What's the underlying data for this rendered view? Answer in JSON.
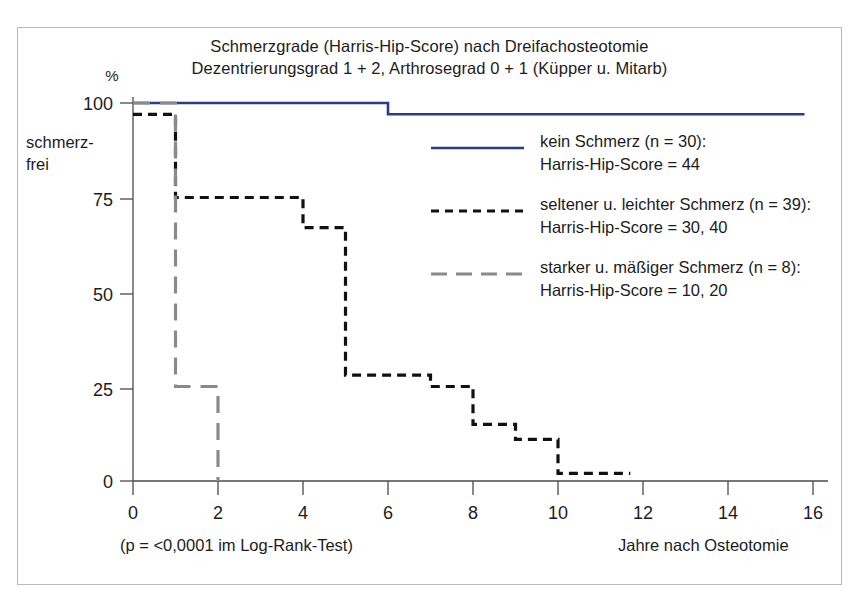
{
  "figure": {
    "title_line1": "Schmerzgrade (Harris-Hip-Score) nach Dreifachosteotomie",
    "title_line2": "Dezentrierungsgrad 1 + 2, Arthrosegrad 0 + 1 (Küpper u. Mitarb)",
    "border_color": "#b9b9b9",
    "background": "#ffffff"
  },
  "axes": {
    "y_unit": "%",
    "y_axis_label_line1": "schmerz-",
    "y_axis_label_line2": "frei",
    "x_axis_label": "Jahre nach Osteotomie",
    "footnote": "(p = <0,0001 im Log-Rank-Test)",
    "y_ticks": [
      "100",
      "75",
      "50",
      "25",
      "0"
    ],
    "x_ticks": [
      "0",
      "2",
      "4",
      "6",
      "8",
      "10",
      "12",
      "14",
      "16"
    ]
  },
  "legend": {
    "position": "inside-top-right",
    "entries": [
      {
        "style": "solid",
        "color": "#2a3a8c",
        "label_line1": "kein Schmerz (n = 30):",
        "label_line2": "Harris-Hip-Score = 44"
      },
      {
        "style": "dashed-short",
        "color": "#111111",
        "label_line1": "seltener u. leichter Schmerz (n = 39):",
        "label_line2": "Harris-Hip-Score = 30, 40"
      },
      {
        "style": "dashed-long",
        "color": "#8a8a8a",
        "label_line1": "starker u. mäßiger Schmerz (n = 8):",
        "label_line2": "Harris-Hip-Score = 10, 20"
      }
    ]
  },
  "chart_data": {
    "type": "line",
    "subtype": "kaplan-meier-step",
    "title": "Schmerzgrade (Harris-Hip-Score) nach Dreifachosteotomie",
    "subtitle": "Dezentrierungsgrad 1 + 2, Arthrosegrad 0 + 1 (Küpper u. Mitarb)",
    "xlabel": "Jahre nach Osteotomie",
    "ylabel": "% schmerzfrei",
    "xlim": [
      0,
      16.6
    ],
    "ylim": [
      0,
      100
    ],
    "xticks": [
      0,
      2,
      4,
      6,
      8,
      10,
      12,
      14,
      16
    ],
    "yticks": [
      0,
      25,
      50,
      75,
      100
    ],
    "grid": false,
    "annotation": "(p = <0,0001 im Log-Rank-Test)",
    "series": [
      {
        "name": "kein Schmerz (n = 30): Harris-Hip-Score = 44",
        "color": "#2a3a8c",
        "style": "solid",
        "n": 30,
        "harris_hip_score": "44",
        "points": [
          {
            "x": 0,
            "y": 100
          },
          {
            "x": 6,
            "y": 100
          },
          {
            "x": 6,
            "y": 97
          },
          {
            "x": 15.8,
            "y": 97
          }
        ]
      },
      {
        "name": "seltener u. leichter Schmerz (n = 39): Harris-Hip-Score = 30, 40",
        "color": "#111111",
        "style": "dashed-short",
        "n": 39,
        "harris_hip_score": "30, 40",
        "points": [
          {
            "x": 0,
            "y": 97
          },
          {
            "x": 1,
            "y": 97
          },
          {
            "x": 1,
            "y": 75
          },
          {
            "x": 4,
            "y": 75
          },
          {
            "x": 4,
            "y": 67
          },
          {
            "x": 5,
            "y": 67
          },
          {
            "x": 5,
            "y": 28
          },
          {
            "x": 7,
            "y": 28
          },
          {
            "x": 7,
            "y": 25
          },
          {
            "x": 8,
            "y": 25
          },
          {
            "x": 8,
            "y": 15
          },
          {
            "x": 9,
            "y": 15
          },
          {
            "x": 9,
            "y": 11
          },
          {
            "x": 10,
            "y": 11
          },
          {
            "x": 10,
            "y": 2
          },
          {
            "x": 11.7,
            "y": 2
          }
        ]
      },
      {
        "name": "starker u. mäßiger Schmerz (n = 8): Harris-Hip-Score = 10, 20",
        "color": "#8a8a8a",
        "style": "dashed-long",
        "n": 8,
        "harris_hip_score": "10, 20",
        "points": [
          {
            "x": 0,
            "y": 100
          },
          {
            "x": 1,
            "y": 100
          },
          {
            "x": 1,
            "y": 25
          },
          {
            "x": 2,
            "y": 25
          },
          {
            "x": 2,
            "y": 0
          }
        ]
      }
    ]
  }
}
